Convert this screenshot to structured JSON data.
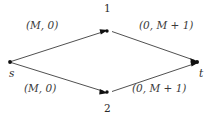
{
  "figure": {
    "type": "directed-flow-network",
    "background_color": "#ffffff",
    "line_color": "#3c3c3c",
    "text_color": "#2a2a2a"
  },
  "nodes": [
    {
      "id": "s",
      "label": "s",
      "x": 10,
      "y": 62,
      "label_x": 9,
      "label_y": 68,
      "style": "italic"
    },
    {
      "id": "n1",
      "label": "1",
      "x": 108,
      "y": 30,
      "label_x": 104,
      "label_y": 3,
      "style": "numeral"
    },
    {
      "id": "n2",
      "label": "2",
      "x": 108,
      "y": 93,
      "label_x": 104,
      "label_y": 103,
      "style": "numeral"
    },
    {
      "id": "t",
      "label": "t",
      "x": 198,
      "y": 62,
      "label_x": 199,
      "label_y": 68,
      "style": "italic"
    }
  ],
  "edges": [
    {
      "from": "s",
      "to": "n1",
      "label": "(M, 0)",
      "label_x": 26,
      "label_y": 20
    },
    {
      "from": "n1",
      "to": "t",
      "label": "(0, M + 1)",
      "label_x": 139,
      "label_y": 20
    },
    {
      "from": "s",
      "to": "n2",
      "label": "(M, 0)",
      "label_x": 24,
      "label_y": 83
    },
    {
      "from": "n2",
      "to": "t",
      "label": "(0, M + 1)",
      "label_x": 132,
      "label_y": 83
    }
  ],
  "labels": {
    "top_left_edge": "(M, 0)",
    "top_right_edge": "(0, M + 1)",
    "bottom_left_edge": "(M, 0)",
    "bottom_right_edge": "(0, M + 1)",
    "node_top": "1",
    "node_bottom": "2",
    "node_source": "s",
    "node_sink": "t"
  }
}
